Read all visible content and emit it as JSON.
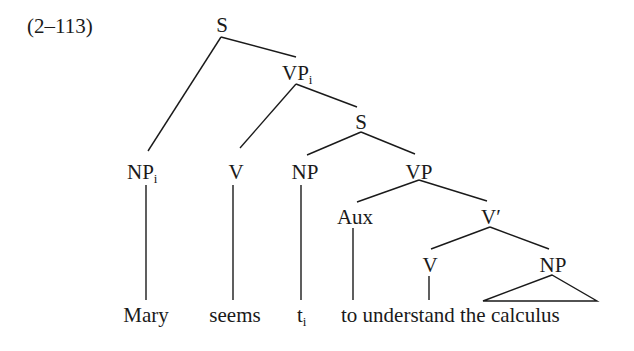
{
  "example_number": "(2–113)",
  "nodes": {
    "S_root": {
      "label": "S"
    },
    "VP_i": {
      "label": "VP",
      "sub": "i"
    },
    "NP_i": {
      "label": "NP",
      "sub": "i"
    },
    "V_seems": {
      "label": "V"
    },
    "S_inner": {
      "label": "S"
    },
    "NP_trace": {
      "label": "NP"
    },
    "VP": {
      "label": "VP"
    },
    "Aux": {
      "label": "Aux"
    },
    "V_bar": {
      "label": "V′"
    },
    "V_understand": {
      "label": "V"
    },
    "NP_obj": {
      "label": "NP"
    }
  },
  "leaves": {
    "mary": "Mary",
    "seems": "seems",
    "trace": "t",
    "trace_sub": "i",
    "to_understand_the_calculus": "to understand the calculus"
  }
}
